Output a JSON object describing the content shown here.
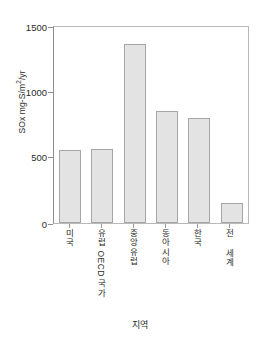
{
  "chart_data": {
    "type": "bar",
    "title": "",
    "xlabel": "지역",
    "ylabel": "SOx mg-S/m2/yr",
    "ylabel_parts": {
      "prefix": "SOx mg-S/m",
      "superscript": "2",
      "suffix": "/yr"
    },
    "categories": [
      "미국",
      "유럽 OECD 국가",
      "중앙유럽",
      "동아시아",
      "한국",
      "전 세계"
    ],
    "values": [
      555,
      570,
      1370,
      855,
      800,
      155
    ],
    "ylim": [
      0,
      1500
    ],
    "yticks": [
      0,
      500,
      1000,
      1500
    ],
    "ytick_labels": [
      "0",
      "500",
      "1000",
      "1500"
    ],
    "grid": false,
    "legend": false,
    "bar_fill_color": "#e3e3e3",
    "bar_border_color": "#a6a6a6",
    "axis_color": "#8d8d8d",
    "text_color": "#2b2b2b",
    "background_color": "#ffffff"
  }
}
